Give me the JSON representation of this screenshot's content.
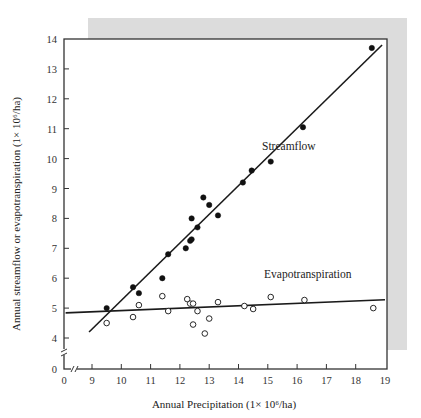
{
  "chart_data": {
    "type": "scatter",
    "title": "",
    "xlabel": "Annual Precipitation (1× 10⁶/ha)",
    "ylabel": "Annual streamflow or evapotranspiration (1× 10⁶/ha)",
    "x_ticks": [
      0,
      9,
      10,
      11,
      12,
      13,
      14,
      15,
      16,
      17,
      18,
      19
    ],
    "y_ticks": [
      0,
      4,
      5,
      6,
      7,
      8,
      9,
      10,
      11,
      12,
      13,
      14
    ],
    "xlim": [
      8.1,
      19
    ],
    "ylim": [
      3.0,
      14
    ],
    "axis_breaks": {
      "x": "between 0 and 9",
      "y": "between 0 and 4"
    },
    "grid": false,
    "legend": "none (inline annotations)",
    "annotations": [
      {
        "text": "Streamflow",
        "x": 14.0,
        "y": 10.4
      },
      {
        "text": "Evapotranspiration",
        "x": 14.1,
        "y": 5.9
      }
    ],
    "series": [
      {
        "name": "Streamflow",
        "marker": "filled-circle",
        "points": [
          [
            9.5,
            5.0
          ],
          [
            10.4,
            5.7
          ],
          [
            10.6,
            5.5
          ],
          [
            11.4,
            6.0
          ],
          [
            11.6,
            6.8
          ],
          [
            12.2,
            7.0
          ],
          [
            12.35,
            7.25
          ],
          [
            12.4,
            7.3
          ],
          [
            12.4,
            8.0
          ],
          [
            12.6,
            7.7
          ],
          [
            12.8,
            8.7
          ],
          [
            13.0,
            8.45
          ],
          [
            13.3,
            8.1
          ],
          [
            14.15,
            9.2
          ],
          [
            14.45,
            9.6
          ],
          [
            15.1,
            9.9
          ],
          [
            16.2,
            11.05
          ],
          [
            18.55,
            13.7
          ]
        ],
        "fit_line": [
          [
            8.9,
            4.2
          ],
          [
            18.9,
            13.8
          ]
        ]
      },
      {
        "name": "Evapotranspiration",
        "marker": "open-circle",
        "points": [
          [
            9.5,
            4.5
          ],
          [
            10.4,
            4.7
          ],
          [
            10.6,
            5.1
          ],
          [
            11.4,
            5.4
          ],
          [
            11.6,
            4.9
          ],
          [
            12.25,
            5.3
          ],
          [
            12.35,
            5.15
          ],
          [
            12.45,
            5.15
          ],
          [
            12.45,
            4.45
          ],
          [
            12.6,
            4.9
          ],
          [
            12.85,
            4.15
          ],
          [
            13.0,
            4.65
          ],
          [
            13.3,
            5.2
          ],
          [
            14.2,
            5.07
          ],
          [
            14.5,
            4.97
          ],
          [
            15.1,
            5.37
          ],
          [
            16.25,
            5.27
          ],
          [
            18.6,
            5.0
          ]
        ],
        "fit_line": [
          [
            8.1,
            4.84
          ],
          [
            19.0,
            5.28
          ]
        ]
      }
    ]
  },
  "labels": {
    "xlabel": "Annual Precipitation (1× 10⁶/ha)",
    "ylabel": "Annual streamflow or evapotranspiration (1× 10⁶/ha)",
    "streamflow": "Streamflow",
    "evapotranspiration": "Evapotranspiration"
  },
  "colors": {
    "shadow": "#dcdcdc",
    "axis": "#333333",
    "marker": "#111111"
  }
}
